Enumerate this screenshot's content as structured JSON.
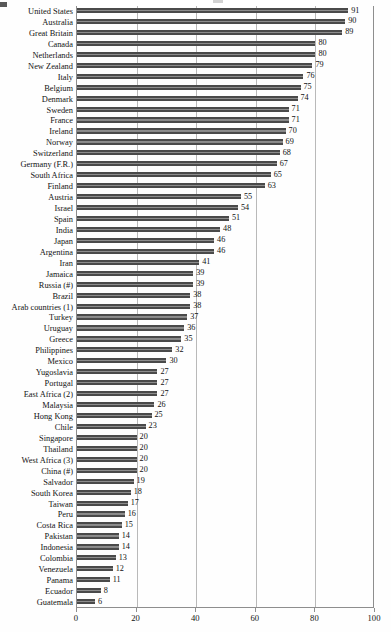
{
  "chart_data": {
    "type": "bar",
    "orientation": "horizontal",
    "title": "",
    "subtitle": "",
    "xlabel": "",
    "ylabel": "",
    "xlim": [
      0,
      100
    ],
    "xticks": [
      0,
      20,
      40,
      60,
      80,
      100
    ],
    "grid": true,
    "gridlines_x": [
      20,
      40,
      60,
      80
    ],
    "legend": "none",
    "value_labels": true,
    "bar_color": "#4f4f4f",
    "categories": [
      "United States",
      "Australia",
      "Great Britain",
      "Canada",
      "Netherlands",
      "New Zealand",
      "Italy",
      "Belgium",
      "Denmark",
      "Sweden",
      "France",
      "Ireland",
      "Norway",
      "Switzerland",
      "Germany (F.R.)",
      "South Africa",
      "Finland",
      "Austria",
      "Israel",
      "Spain",
      "India",
      "Japan",
      "Argentina",
      "Iran",
      "Jamaica",
      "Russia (#)",
      "Brazil",
      "Arab countries (1)",
      "Turkey",
      "Uruguay",
      "Greece",
      "Philippines",
      "Mexico",
      "Yugoslavia",
      "Portugal",
      "East Africa (2)",
      "Malaysia",
      "Hong Kong",
      "Chile",
      "Singapore",
      "Thailand",
      "West Africa (3)",
      "China (#)",
      "Salvador",
      "South Korea",
      "Taiwan",
      "Peru",
      "Costa Rica",
      "Pakistan",
      "Indonesia",
      "Colombia",
      "Venezuela",
      "Panama",
      "Ecuador",
      "Guatemala"
    ],
    "values": [
      91,
      90,
      89,
      80,
      80,
      79,
      76,
      75,
      74,
      71,
      71,
      70,
      69,
      68,
      67,
      65,
      63,
      55,
      54,
      51,
      48,
      46,
      46,
      41,
      39,
      39,
      38,
      38,
      37,
      36,
      35,
      32,
      30,
      27,
      27,
      27,
      26,
      25,
      23,
      20,
      20,
      20,
      20,
      19,
      18,
      17,
      16,
      15,
      14,
      14,
      13,
      12,
      11,
      8,
      6
    ]
  }
}
